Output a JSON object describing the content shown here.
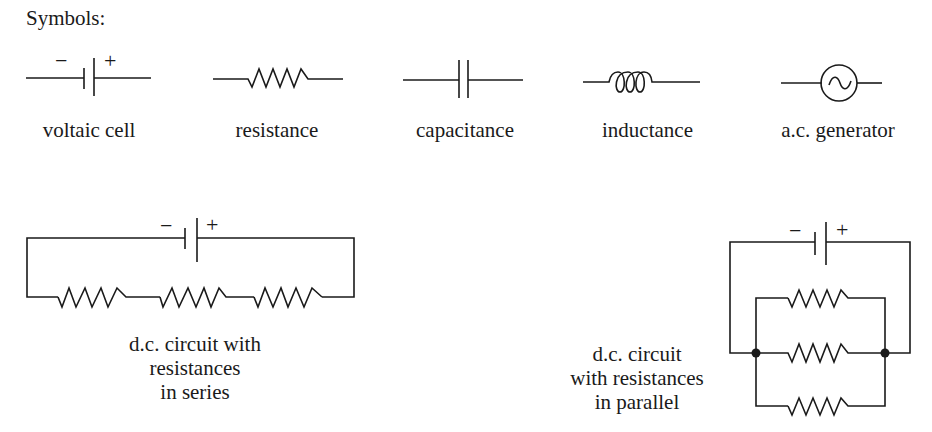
{
  "title": "Symbols:",
  "symbols": [
    {
      "id": "voltaic-cell",
      "label": "voltaic cell",
      "minus": "−",
      "plus": "+"
    },
    {
      "id": "resistance",
      "label": "resistance"
    },
    {
      "id": "capacitance",
      "label": "capacitance"
    },
    {
      "id": "inductance",
      "label": "inductance"
    },
    {
      "id": "ac-generator",
      "label": "a.c. generator"
    }
  ],
  "circuits": {
    "series": {
      "caption_lines": [
        "d.c. circuit with",
        "resistances",
        "in series"
      ],
      "minus": "−",
      "plus": "+",
      "resistor_count": 3
    },
    "parallel": {
      "caption_lines": [
        "d.c. circuit",
        "with resistances",
        "in parallel"
      ],
      "minus": "−",
      "plus": "+",
      "resistor_count": 3,
      "junction_count": 2
    }
  },
  "colors": {
    "ink": "#1a1a1a",
    "background": "#ffffff"
  }
}
